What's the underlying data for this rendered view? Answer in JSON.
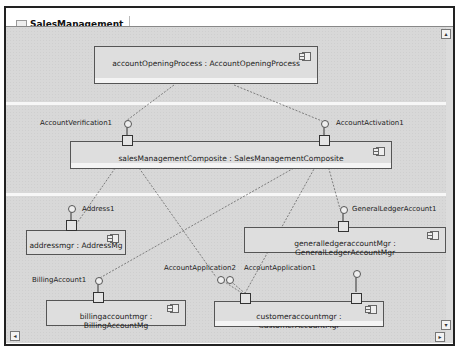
{
  "window": {
    "tab_title": "SalesManagement"
  },
  "components": {
    "accountOpeningProcess": "accountOpeningProcess : AccountOpeningProcess",
    "salesManagementComposite": "salesManagementComposite : SalesManagementComposite",
    "addressmgr": "addressmgr : AddressMg",
    "generalledgeraccountMgr": "generalledgeraccountMgr : GeneralLedgerAccountMgr",
    "billingaccountmgr": "billingaccountmgr : BillingAccountMg",
    "customeraccountmgr": "customeraccountmgr : CustomerAccountMgr"
  },
  "interfaces": {
    "accountVerification": "AccountVerification1",
    "accountActivation": "AccountActivation1",
    "address": "Address1",
    "generalLedgerAccount": "GeneralLedgerAccount1",
    "billingAccount": "BillingAccount1",
    "accountApplication2": "AccountApplication2",
    "accountApplication1": "AccountApplication1"
  },
  "scroll": {
    "up": "▴",
    "left": "◂",
    "down": "▾",
    "right": "▸"
  }
}
